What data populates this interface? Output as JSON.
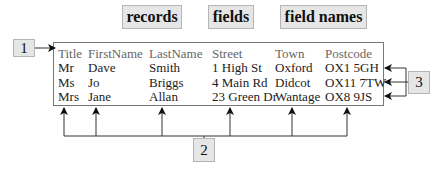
{
  "labels": {
    "records": "records",
    "fields": "fields",
    "field_names": "field names"
  },
  "markers": {
    "one": "1",
    "two": "2",
    "three": "3"
  },
  "table": {
    "headers": [
      "Title",
      "FirstName",
      "LastName",
      "Street",
      "Town",
      "Postcode"
    ],
    "rows": [
      [
        "Mr",
        "Dave",
        "Smith",
        "1 High St",
        "Oxford",
        "OX1 5GH"
      ],
      [
        "Ms",
        "Jo",
        "Briggs",
        "4 Main Rd",
        "Didcot",
        "OX11 7TW"
      ],
      [
        "Mrs",
        "Jane",
        "Allan",
        "23 Green Dr",
        "Wantage",
        "OX8 9JS"
      ]
    ]
  },
  "colors": {
    "box_fill": "#e6e6e6",
    "box_border": "#b5b5b5",
    "header_text": "#666666",
    "line": "#555555"
  }
}
